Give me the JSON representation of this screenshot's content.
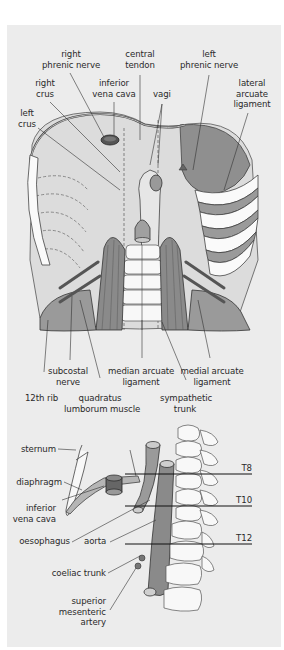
{
  "figure_top": {
    "title": "Diaphragm, inferior (abdominal) view",
    "labels": {
      "right_phrenic_nerve": [
        "right",
        "phrenic nerve"
      ],
      "central_tendon": [
        "central",
        "tendon"
      ],
      "left_phrenic_nerve": [
        "left",
        "phrenic nerve"
      ],
      "right_crus": [
        "right",
        "crus"
      ],
      "inferior_vena_cava": [
        "inferior",
        "vena cava"
      ],
      "vagi": [
        "vagi"
      ],
      "lateral_arcuate_ligament": [
        "lateral",
        "arcuate",
        "ligament"
      ],
      "left_crus": [
        "left",
        "crus"
      ],
      "subcostal_nerve": [
        "subcostal",
        "nerve"
      ],
      "median_arcuate_ligament": [
        "median arcuate",
        "ligament"
      ],
      "medial_arcuate_ligament": [
        "medial arcuate",
        "ligament"
      ],
      "twelfth_rib": [
        "12th rib"
      ],
      "quadratus_lumborum_muscle": [
        "quadratus",
        "lumborum muscle"
      ],
      "sympathetic_trunk": [
        "sympathetic",
        "trunk"
      ]
    }
  },
  "figure_bottom": {
    "title": "Diaphragm, lateral view with vertebral levels",
    "labels": {
      "sternum": "sternum",
      "diaphragm": "diaphragm",
      "inferior_vena_cava": [
        "inferior",
        "vena cava"
      ],
      "oesophagus": "oesophagus",
      "aorta": "aorta",
      "coeliac_trunk": "coeliac trunk",
      "superior_mesenteric_artery": [
        "superior",
        "mesenteric",
        "artery"
      ]
    },
    "vertebral_levels": [
      "T8",
      "T10",
      "T12"
    ]
  },
  "colors": {
    "background": "#ececec",
    "muscle_dark": "#8a8a8a",
    "muscle_mid": "#a9a9a9",
    "light_fill": "#f7f7f7",
    "line": "#3a3a3a"
  }
}
